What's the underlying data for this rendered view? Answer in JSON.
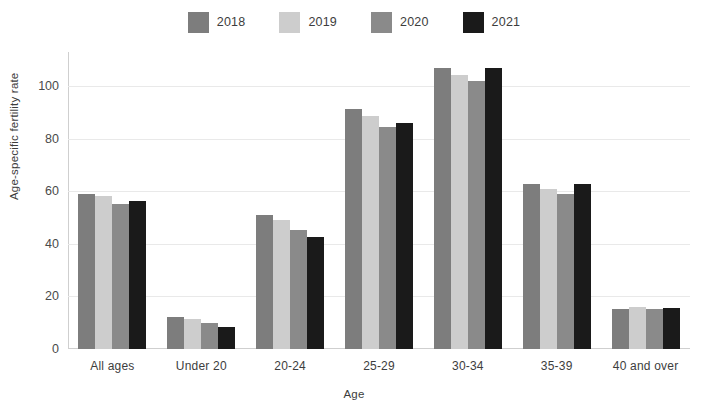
{
  "chart_data": {
    "type": "bar",
    "title": "",
    "xlabel": "Age",
    "ylabel": "Age-specific fertility rate",
    "categories": [
      "All ages",
      "Under 20",
      "20-24",
      "25-29",
      "30-34",
      "35-39",
      "40 and over"
    ],
    "series": [
      {
        "name": "2018",
        "color": "#7d7d7d",
        "values": [
          59.1,
          12.1,
          50.8,
          91.3,
          107.0,
          62.6,
          15.4
        ]
      },
      {
        "name": "2019",
        "color": "#cdcdcd",
        "values": [
          58.2,
          11.4,
          49.0,
          88.7,
          104.2,
          61.0,
          16.1
        ]
      },
      {
        "name": "2020",
        "color": "#8a8a8a",
        "values": [
          55.3,
          10.0,
          45.2,
          84.6,
          101.8,
          58.8,
          15.4
        ]
      },
      {
        "name": "2021",
        "color": "#1a1a1a",
        "values": [
          56.3,
          8.3,
          42.8,
          86.1,
          106.8,
          62.7,
          15.5
        ]
      }
    ],
    "ylim": [
      0,
      113
    ],
    "yticks": [
      0,
      20,
      40,
      60,
      80,
      100
    ],
    "ytick_labels": [
      "0",
      "20",
      "40",
      "60",
      "80",
      "100"
    ],
    "grid": true,
    "legend_position": "top-center"
  },
  "legend": {
    "items": [
      {
        "label": "2018"
      },
      {
        "label": "2019"
      },
      {
        "label": "2020"
      },
      {
        "label": "2021"
      }
    ]
  },
  "axes": {
    "x_title": "Age",
    "y_title": "Age-specific fertility rate"
  }
}
